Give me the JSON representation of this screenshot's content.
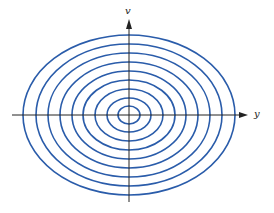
{
  "diagram": {
    "axes": {
      "x_label": "y",
      "y_label": "v"
    },
    "center": [
      129,
      115
    ],
    "ellipse_color": "#2a5caa",
    "axis_color": "#222222",
    "ellipses": [
      {
        "rx": 11,
        "ry": 9
      },
      {
        "rx": 22,
        "ry": 17
      },
      {
        "rx": 34,
        "ry": 26
      },
      {
        "rx": 46,
        "ry": 35
      },
      {
        "rx": 57,
        "ry": 44
      },
      {
        "rx": 69,
        "ry": 53
      },
      {
        "rx": 81,
        "ry": 62
      },
      {
        "rx": 93,
        "ry": 71
      },
      {
        "rx": 106,
        "ry": 80
      }
    ]
  }
}
